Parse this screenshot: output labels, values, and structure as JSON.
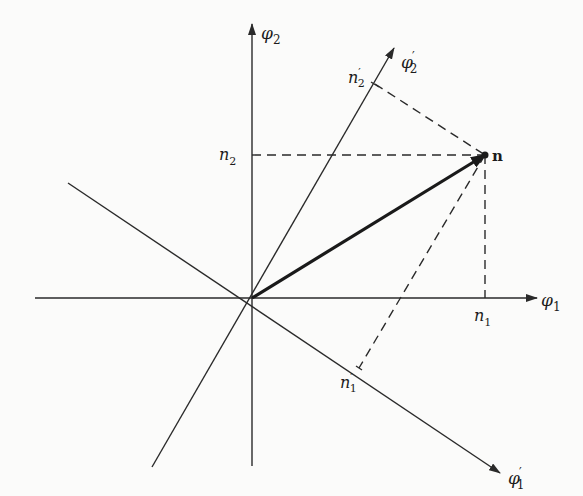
{
  "diagram": {
    "type": "vector-projection-rotated-axes",
    "colors": {
      "line": "#2a2a2a",
      "background": "#fbfbfa"
    },
    "origin": [
      252,
      298
    ],
    "axes": [
      {
        "id": "phi1",
        "label": "φ",
        "sub": "1",
        "prime": "",
        "from": [
          35,
          298
        ],
        "to": [
          537,
          298
        ],
        "label_pos": [
          541,
          306
        ]
      },
      {
        "id": "phi2",
        "label": "φ",
        "sub": "2",
        "prime": "",
        "from": [
          252,
          466
        ],
        "to": [
          252,
          24
        ],
        "label_pos": [
          262,
          37
        ]
      },
      {
        "id": "phi1prime",
        "label": "φ",
        "sub": "1",
        "prime": "′",
        "from": [
          68,
          183
        ],
        "to": [
          500,
          473
        ],
        "label_pos": [
          508,
          483
        ]
      },
      {
        "id": "phi2prime",
        "label": "φ",
        "sub": "2",
        "prime": "′",
        "from": [
          152,
          467
        ],
        "to": [
          394,
          48
        ],
        "label_pos": [
          402,
          67
        ]
      }
    ],
    "vector": {
      "label": "n",
      "from": [
        252,
        298
      ],
      "to": [
        485,
        155
      ],
      "label_pos": [
        493,
        162
      ]
    },
    "projections": {
      "n1": {
        "label": "n",
        "sub": "1",
        "prime": "",
        "point": [
          485,
          298
        ],
        "label_pos": [
          470,
          321
        ]
      },
      "n2": {
        "label": "n",
        "sub": "2",
        "prime": "",
        "point": [
          252,
          155
        ],
        "label_pos": [
          219,
          162
        ]
      },
      "n1prime": {
        "label": "n",
        "sub": "1",
        "prime": "′",
        "point": [
          359,
          368
        ],
        "label_pos": [
          340,
          387
        ]
      },
      "n2prime": {
        "label": "n",
        "sub": "2",
        "prime": "′",
        "point": [
          375,
          84
        ],
        "label_pos": [
          348,
          81
        ]
      }
    },
    "labels": {
      "phi1": "φ₁",
      "phi2": "φ₂",
      "phi1_prime": "φ′₁",
      "phi2_prime": "φ′₂",
      "n1": "n₁",
      "n2": "n₂",
      "n1_prime": "n′₁",
      "n2_prime": "n′₂",
      "vector_n": "n"
    }
  }
}
